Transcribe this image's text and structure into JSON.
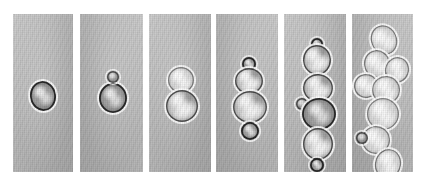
{
  "figure": {
    "modality": "light micrograph",
    "organism": "budding yeast",
    "background_color": "#ffffff",
    "panel_color": "#b9b9b9",
    "cell_rim_color": "#282828",
    "halo_color": "#ffffff",
    "panel_count": 6,
    "caption": ""
  },
  "panels": [
    {
      "index": 1,
      "name": "panel-1",
      "stage_label": "single unbudded cell",
      "cell_count": 1,
      "x": 13,
      "y": 14,
      "width": 60,
      "height": 158,
      "cells": [
        {
          "name": "mother-cell",
          "cx": 30,
          "cy": 82,
          "rx": 13,
          "ry": 15,
          "tone": "dark",
          "rot": -8
        }
      ]
    },
    {
      "index": 2,
      "name": "panel-2",
      "stage_label": "cell with emerging bud",
      "cell_count": 2,
      "x": 80,
      "y": 14,
      "width": 63,
      "height": 158,
      "cells": [
        {
          "name": "mother-cell",
          "cx": 33,
          "cy": 84,
          "rx": 14,
          "ry": 15,
          "tone": "dark",
          "rot": 0
        },
        {
          "name": "small-bud",
          "cx": 33,
          "cy": 63,
          "rx": 6,
          "ry": 6,
          "tone": "tiny",
          "rot": 0
        }
      ]
    },
    {
      "index": 3,
      "name": "panel-3",
      "stage_label": "large bud, two-cell pair",
      "cell_count": 2,
      "x": 149,
      "y": 14,
      "width": 62,
      "height": 158,
      "cells": [
        {
          "name": "daughter-cell",
          "cx": 32,
          "cy": 66,
          "rx": 13,
          "ry": 13,
          "tone": "pale",
          "rot": 0
        },
        {
          "name": "mother-cell",
          "cx": 33,
          "cy": 92,
          "rx": 16,
          "ry": 16,
          "tone": "normal",
          "rot": 0
        }
      ]
    },
    {
      "index": 4,
      "name": "panel-4",
      "stage_label": "four-cell chain",
      "cell_count": 4,
      "x": 216,
      "y": 14,
      "width": 62,
      "height": 158,
      "cells": [
        {
          "name": "bud-top",
          "cx": 33,
          "cy": 50,
          "rx": 7,
          "ry": 7,
          "tone": "dark",
          "rot": 0
        },
        {
          "name": "cell-upper",
          "cx": 33,
          "cy": 67,
          "rx": 14,
          "ry": 13,
          "tone": "normal",
          "rot": 0
        },
        {
          "name": "cell-lower",
          "cx": 34,
          "cy": 93,
          "rx": 17,
          "ry": 16,
          "tone": "normal",
          "rot": 0
        },
        {
          "name": "bud-bottom",
          "cx": 34,
          "cy": 117,
          "rx": 9,
          "ry": 9,
          "tone": "dark",
          "rot": 0
        }
      ]
    },
    {
      "index": 5,
      "name": "panel-5",
      "stage_label": "six-cell chain",
      "cell_count": 6,
      "x": 284,
      "y": 14,
      "width": 62,
      "height": 158,
      "cells": [
        {
          "name": "bud-top",
          "cx": 33,
          "cy": 30,
          "rx": 6,
          "ry": 6,
          "tone": "dark",
          "rot": 0
        },
        {
          "name": "cell-1",
          "cx": 33,
          "cy": 46,
          "rx": 14,
          "ry": 15,
          "tone": "normal",
          "rot": -4
        },
        {
          "name": "cell-2",
          "cx": 34,
          "cy": 74,
          "rx": 15,
          "ry": 14,
          "tone": "normal",
          "rot": 4
        },
        {
          "name": "side-bud",
          "cx": 18,
          "cy": 90,
          "rx": 6,
          "ry": 6,
          "tone": "tiny",
          "rot": 0
        },
        {
          "name": "cell-3",
          "cx": 35,
          "cy": 100,
          "rx": 17,
          "ry": 16,
          "tone": "dark",
          "rot": 0
        },
        {
          "name": "cell-4",
          "cx": 34,
          "cy": 130,
          "rx": 15,
          "ry": 16,
          "tone": "normal",
          "rot": 0
        },
        {
          "name": "bud-bottom",
          "cx": 33,
          "cy": 151,
          "rx": 7,
          "ry": 7,
          "tone": "dark",
          "rot": 0
        }
      ]
    },
    {
      "index": 6,
      "name": "panel-6",
      "stage_label": "branched multicell cluster",
      "cell_count": 9,
      "x": 352,
      "y": 14,
      "width": 61,
      "height": 158,
      "cells": [
        {
          "name": "cell-a",
          "cx": 32,
          "cy": 26,
          "rx": 13,
          "ry": 15,
          "tone": "pale",
          "rot": -22
        },
        {
          "name": "cell-b",
          "cx": 25,
          "cy": 50,
          "rx": 13,
          "ry": 14,
          "tone": "pale",
          "rot": -10
        },
        {
          "name": "cell-c",
          "cx": 45,
          "cy": 56,
          "rx": 12,
          "ry": 13,
          "tone": "pale",
          "rot": 18
        },
        {
          "name": "cell-d",
          "cx": 14,
          "cy": 72,
          "rx": 12,
          "ry": 12,
          "tone": "pale",
          "rot": -14
        },
        {
          "name": "cell-e",
          "cx": 34,
          "cy": 76,
          "rx": 14,
          "ry": 14,
          "tone": "pale",
          "rot": 6
        },
        {
          "name": "cell-f",
          "cx": 31,
          "cy": 100,
          "rx": 16,
          "ry": 16,
          "tone": "pale",
          "rot": 0
        },
        {
          "name": "cell-g",
          "cx": 24,
          "cy": 126,
          "rx": 14,
          "ry": 14,
          "tone": "pale",
          "rot": -8
        },
        {
          "name": "side-bud",
          "cx": 10,
          "cy": 124,
          "rx": 6,
          "ry": 6,
          "tone": "tiny",
          "rot": 0
        },
        {
          "name": "cell-h",
          "cx": 36,
          "cy": 150,
          "rx": 13,
          "ry": 15,
          "tone": "pale",
          "rot": 14
        }
      ]
    }
  ]
}
